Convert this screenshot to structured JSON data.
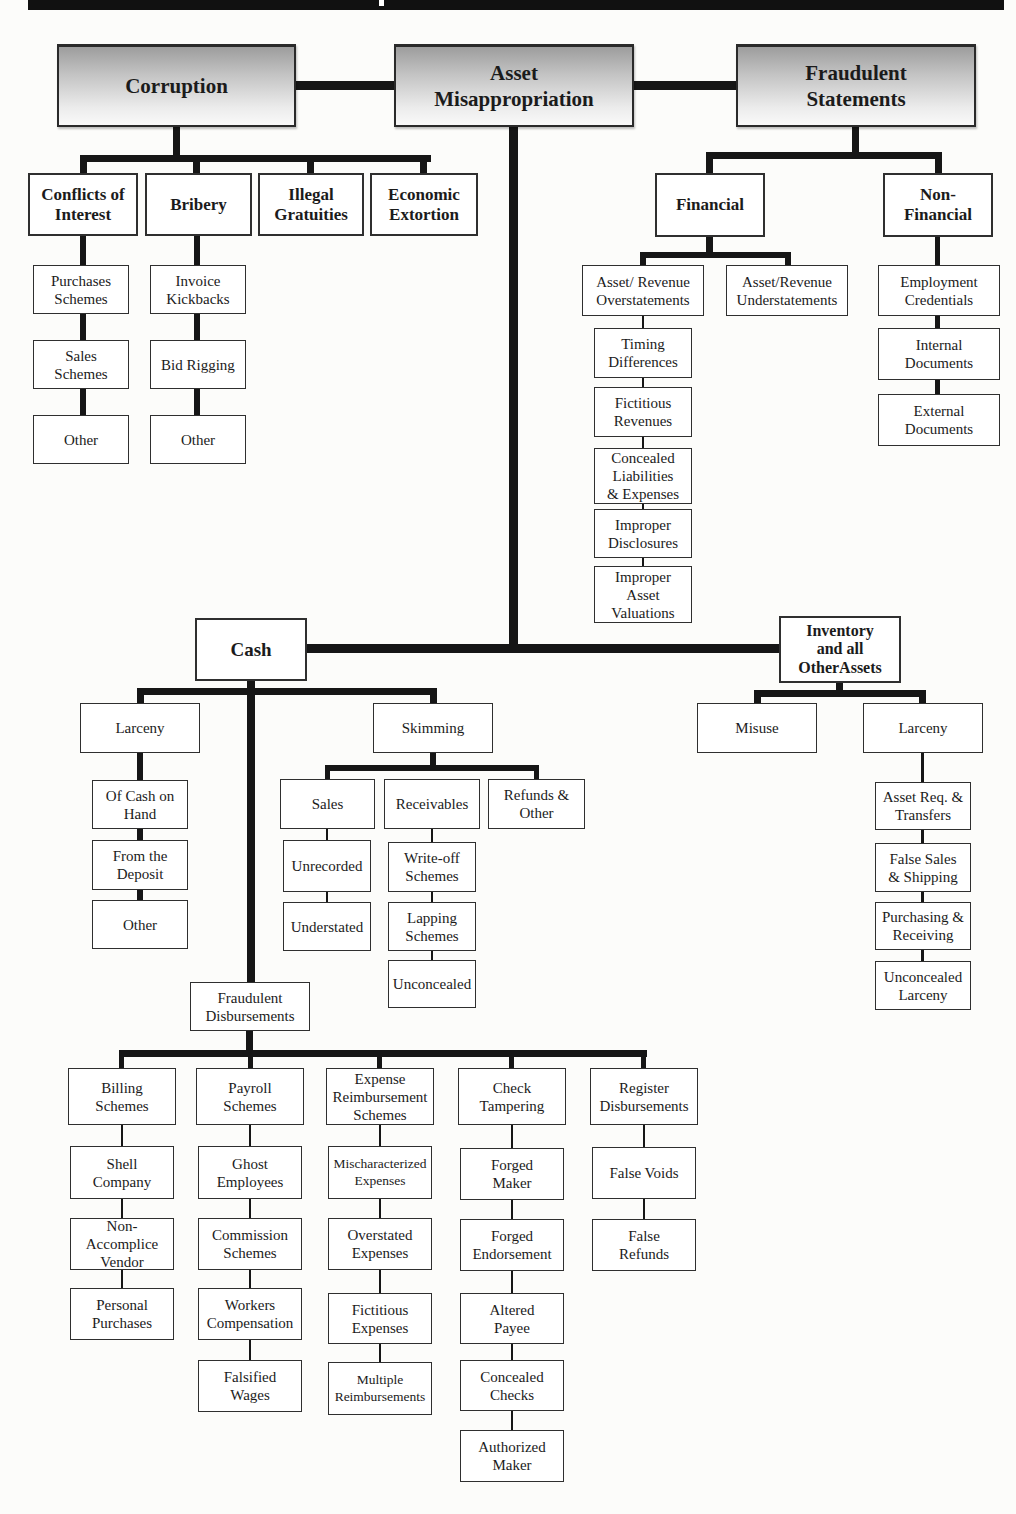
{
  "header_bar": {
    "color": "#111111",
    "notch_color": "#ffffff"
  },
  "colors": {
    "line": "#161616",
    "box_border": "#2f2f2f",
    "top_box_fill_top": "#9d9d9d",
    "top_box_fill_bottom": "#f9f9f9",
    "page_bg": "#fcfcfa"
  },
  "tree": {
    "corruption": {
      "label": "Corruption",
      "children": {
        "conflicts_of_interest": {
          "label": "Conflicts of\nInterest",
          "children": {
            "purchases_schemes": {
              "label": "Purchases\nSchemes"
            },
            "sales_schemes": {
              "label": "Sales\nSchemes"
            },
            "other": {
              "label": "Other"
            }
          }
        },
        "bribery": {
          "label": "Bribery",
          "children": {
            "invoice_kickbacks": {
              "label": "Invoice\nKickbacks"
            },
            "bid_rigging": {
              "label": "Bid Rigging"
            },
            "other": {
              "label": "Other"
            }
          }
        },
        "illegal_gratuities": {
          "label": "Illegal\nGratuities"
        },
        "economic_extortion": {
          "label": "Economic\nExtortion"
        }
      }
    },
    "asset_misappropriation": {
      "label": "Asset\nMisappropriation",
      "children": {
        "cash": {
          "label": "Cash",
          "children": {
            "larceny": {
              "label": "Larceny",
              "children": {
                "of_cash_on_hand": {
                  "label": "Of Cash on\nHand"
                },
                "from_the_deposit": {
                  "label": "From the\nDeposit"
                },
                "other": {
                  "label": "Other"
                }
              }
            },
            "skimming": {
              "label": "Skimming",
              "children": {
                "sales": {
                  "label": "Sales",
                  "children": {
                    "unrecorded": {
                      "label": "Unrecorded"
                    },
                    "understated": {
                      "label": "Understated"
                    }
                  }
                },
                "receivables": {
                  "label": "Receivables",
                  "children": {
                    "write_off_schemes": {
                      "label": "Write-off\nSchemes"
                    },
                    "lapping_schemes": {
                      "label": "Lapping\nSchemes"
                    },
                    "unconcealed": {
                      "label": "Unconcealed"
                    }
                  }
                },
                "refunds_other": {
                  "label": "Refunds &\nOther"
                }
              }
            },
            "fraudulent_disbursements": {
              "label": "Fraudulent\nDisbursements",
              "children": {
                "billing_schemes": {
                  "label": "Billing\nSchemes",
                  "children": {
                    "shell_company": {
                      "label": "Shell\nCompany"
                    },
                    "non_accomplice_vendor": {
                      "label": "Non-\nAccomplice\nVendor"
                    },
                    "personal_purchases": {
                      "label": "Personal\nPurchases"
                    }
                  }
                },
                "payroll_schemes": {
                  "label": "Payroll\nSchemes",
                  "children": {
                    "ghost_employees": {
                      "label": "Ghost\nEmployees"
                    },
                    "commission_schemes": {
                      "label": "Commission\nSchemes"
                    },
                    "workers_compensation": {
                      "label": "Workers\nCompensation"
                    },
                    "falsified_wages": {
                      "label": "Falsified\nWages"
                    }
                  }
                },
                "expense_reimbursement_schemes": {
                  "label": "Expense\nReimbursement\nSchemes",
                  "children": {
                    "mischaracterized_expenses": {
                      "label": "Mischaracterized\nExpenses"
                    },
                    "overstated_expenses": {
                      "label": "Overstated\nExpenses"
                    },
                    "fictitious_expenses": {
                      "label": "Fictitious\nExpenses"
                    },
                    "multiple_reimbursements": {
                      "label": "Multiple\nReimbursements"
                    }
                  }
                },
                "check_tampering": {
                  "label": "Check\nTampering",
                  "children": {
                    "forged_maker": {
                      "label": "Forged\nMaker"
                    },
                    "forged_endorsement": {
                      "label": "Forged\nEndorsement"
                    },
                    "altered_payee": {
                      "label": "Altered\nPayee"
                    },
                    "concealed_checks": {
                      "label": "Concealed\nChecks"
                    },
                    "authorized_maker": {
                      "label": "Authorized\nMaker"
                    }
                  }
                },
                "register_disbursements": {
                  "label": "Register\nDisbursements",
                  "children": {
                    "false_voids": {
                      "label": "False Voids"
                    },
                    "false_refunds": {
                      "label": "False\nRefunds"
                    }
                  }
                }
              }
            }
          }
        },
        "inventory": {
          "label": "Inventory\nand all\nOtherAssets",
          "children": {
            "misuse": {
              "label": "Misuse"
            },
            "larceny": {
              "label": "Larceny",
              "children": {
                "asset_req_transfers": {
                  "label": "Asset Req. &\nTransfers"
                },
                "false_sales_shipping": {
                  "label": "False Sales\n& Shipping"
                },
                "purchasing_receiving": {
                  "label": "Purchasing &\nReceiving"
                },
                "unconcealed_larceny": {
                  "label": "Unconcealed\nLarceny"
                }
              }
            }
          }
        }
      }
    },
    "fraudulent_statements": {
      "label": "Fraudulent\nStatements",
      "children": {
        "financial": {
          "label": "Financial",
          "children": {
            "asset_revenue_overstatements": {
              "label": "Asset/ Revenue\nOverstatements",
              "children": {
                "timing_differences": {
                  "label": "Timing\nDifferences"
                },
                "fictitious_revenues": {
                  "label": "Fictitious\nRevenues"
                },
                "concealed_liabilities_expenses": {
                  "label": "Concealed\nLiabilities\n& Expenses"
                },
                "improper_disclosures": {
                  "label": "Improper\nDisclosures"
                },
                "improper_asset_valuations": {
                  "label": "Improper\nAsset\nValuations"
                }
              }
            },
            "asset_revenue_understatements": {
              "label": "Asset/Revenue\nUnderstatements"
            }
          }
        },
        "non_financial": {
          "label": "Non-\nFinancial",
          "children": {
            "employment_credentials": {
              "label": "Employment\nCredentials"
            },
            "internal_documents": {
              "label": "Internal\nDocuments"
            },
            "external_documents": {
              "label": "External\nDocuments"
            }
          }
        }
      }
    }
  }
}
